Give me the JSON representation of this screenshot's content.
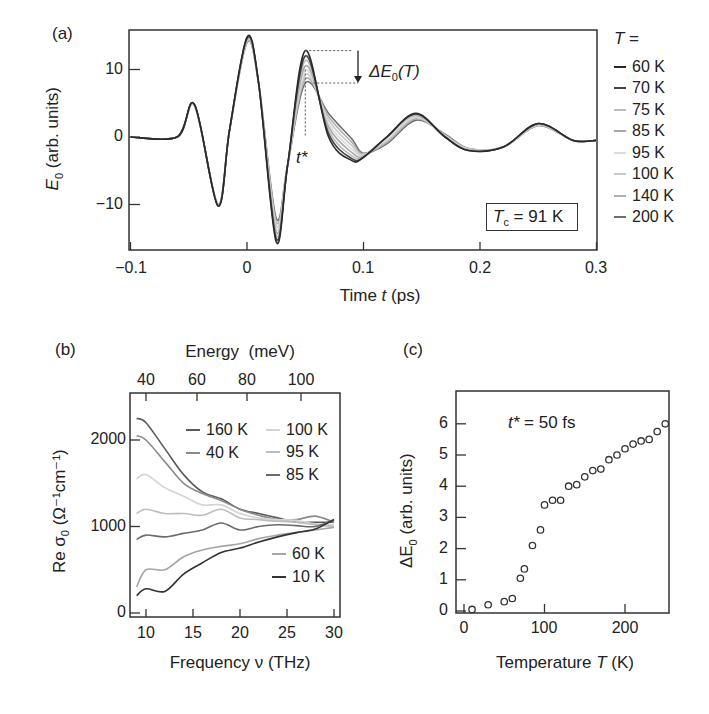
{
  "chart_data": [
    {
      "panel": "(a)",
      "type": "line",
      "title": "",
      "xlabel": "Time t (ps)",
      "ylabel": "E0 (arb. units)",
      "xlim": [
        -0.1,
        0.3
      ],
      "ylim": [
        -16,
        15
      ],
      "xticks": [
        "-0.1",
        "0",
        "0.1",
        "0.2",
        "0.3"
      ],
      "yticks": [
        "-10",
        "0",
        "10"
      ],
      "legend_title": "T =",
      "legend_position": "right outside",
      "annotations": [
        "ΔE0(T)",
        "t*",
        "Tc = 91 K"
      ],
      "x": [
        -0.1,
        -0.06,
        -0.045,
        -0.025,
        -0.015,
        0,
        0.01,
        0.025,
        0.035,
        0.05,
        0.07,
        0.09,
        0.1,
        0.12,
        0.145,
        0.17,
        0.19,
        0.22,
        0.25,
        0.28,
        0.3
      ],
      "series": [
        {
          "name": "60 K",
          "values": [
            0,
            0,
            4.8,
            -10.2,
            1,
            14.8,
            8,
            -15.5,
            -4,
            12.8,
            0,
            -3.5,
            -3,
            0,
            3.5,
            0,
            -2,
            -1.5,
            2,
            -0.5,
            -0.5
          ]
        },
        {
          "name": "70 K",
          "values": [
            0,
            0,
            4.8,
            -10.2,
            1,
            14.6,
            8,
            -15,
            -4,
            12,
            0.5,
            -3.2,
            -3,
            0,
            3.4,
            0,
            -2,
            -1.5,
            2,
            -0.5,
            -0.5
          ]
        },
        {
          "name": "75 K",
          "values": [
            0,
            0,
            4.7,
            -10.1,
            1,
            14.5,
            8,
            -14.5,
            -4,
            11.3,
            1,
            -2.8,
            -2.9,
            0,
            3.3,
            0,
            -1.9,
            -1.5,
            1.9,
            -0.5,
            -0.5
          ]
        },
        {
          "name": "85 K",
          "values": [
            0,
            0,
            4.7,
            -10,
            1,
            14.4,
            8,
            -14,
            -4,
            10.5,
            1.5,
            -2.3,
            -2.8,
            0,
            3.2,
            0,
            -1.9,
            -1.5,
            1.9,
            -0.5,
            -0.5
          ]
        },
        {
          "name": "95 K",
          "values": [
            0,
            0,
            4.6,
            -10,
            1,
            14.3,
            8,
            -13.5,
            -4,
            9.8,
            2,
            -1.8,
            -2.7,
            -0.3,
            3,
            0.1,
            -1.8,
            -1.5,
            1.8,
            -0.5,
            -0.5
          ]
        },
        {
          "name": "100 K",
          "values": [
            0,
            0,
            4.6,
            -10,
            1,
            14.2,
            8,
            -13,
            -4,
            9.2,
            2.5,
            -1.3,
            -2.6,
            -0.5,
            2.9,
            0.2,
            -1.8,
            -1.5,
            1.8,
            -0.5,
            -0.5
          ]
        },
        {
          "name": "140 K",
          "values": [
            0,
            0,
            4.6,
            -10,
            1,
            14.1,
            8,
            -12.5,
            -4,
            8.6,
            3,
            -0.8,
            -2.5,
            -0.8,
            2.7,
            0.3,
            -1.7,
            -1.5,
            1.7,
            -0.5,
            -0.5
          ]
        },
        {
          "name": "200 K",
          "values": [
            0,
            0,
            4.6,
            -10,
            1,
            14,
            8,
            -12,
            -4,
            8,
            3.5,
            -0.3,
            -2.4,
            -1,
            2.5,
            0.4,
            -1.7,
            -1.5,
            1.7,
            -0.5,
            -0.5
          ]
        }
      ]
    },
    {
      "panel": "(b)",
      "type": "line",
      "title": "",
      "xlabel": "Frequency ν (THz)",
      "ylabel": "Re σ0 (Ω⁻¹cm⁻¹)",
      "top_xlabel": "Energy (meV)",
      "xlim": [
        8.5,
        30.5
      ],
      "ylim": [
        -50,
        2450
      ],
      "xticks": [
        "10",
        "15",
        "20",
        "25",
        "30"
      ],
      "yticks": [
        "0",
        "1000",
        "2000"
      ],
      "top_xticks": [
        "40",
        "60",
        "80",
        "100"
      ],
      "legend_position": "inside",
      "x": [
        9,
        10,
        12,
        14,
        16,
        18,
        20,
        22,
        24,
        26,
        28,
        30
      ],
      "series": [
        {
          "name": "160 K",
          "values": [
            2250,
            2200,
            1900,
            1600,
            1400,
            1320,
            1200,
            1150,
            1100,
            1050,
            1050,
            1050
          ]
        },
        {
          "name": "40 K",
          "values": [
            2050,
            2000,
            1750,
            1500,
            1380,
            1300,
            1200,
            1130,
            1080,
            1080,
            1120,
            1050
          ]
        },
        {
          "name": "100 K",
          "values": [
            1550,
            1600,
            1450,
            1350,
            1250,
            1250,
            1150,
            1100,
            1080,
            1070,
            1030,
            1020
          ]
        },
        {
          "name": "95 K",
          "values": [
            1150,
            1200,
            1150,
            1150,
            1130,
            1200,
            1100,
            1080,
            1060,
            1050,
            1020,
            1000
          ]
        },
        {
          "name": "85 K",
          "values": [
            850,
            900,
            880,
            920,
            960,
            1040,
            960,
            1000,
            1020,
            1010,
            1000,
            1080
          ]
        },
        {
          "name": "60 K",
          "values": [
            300,
            500,
            500,
            650,
            730,
            770,
            800,
            860,
            900,
            930,
            960,
            990
          ]
        },
        {
          "name": "10 K",
          "values": [
            200,
            280,
            250,
            450,
            580,
            700,
            750,
            820,
            880,
            930,
            970,
            1080
          ]
        }
      ]
    },
    {
      "panel": "(c)",
      "type": "scatter",
      "title": "",
      "xlabel": "Temperature T (K)",
      "ylabel": "ΔE0 (arb. units)",
      "xlim": [
        -10,
        255
      ],
      "ylim": [
        0,
        7
      ],
      "xticks": [
        "0",
        "100",
        "200"
      ],
      "yticks": [
        "0",
        "1",
        "2",
        "3",
        "4",
        "5",
        "6"
      ],
      "annotations": [
        "t* = 50 fs"
      ],
      "series": [
        {
          "name": "ΔE0",
          "x": [
            10,
            30,
            50,
            60,
            70,
            75,
            85,
            95,
            100,
            110,
            120,
            130,
            140,
            150,
            160,
            170,
            180,
            190,
            200,
            210,
            220,
            230,
            240,
            250
          ],
          "values": [
            0.05,
            0.2,
            0.3,
            0.4,
            1.05,
            1.35,
            2.1,
            2.6,
            3.4,
            3.55,
            3.55,
            4.0,
            4.05,
            4.3,
            4.5,
            4.55,
            4.85,
            5.0,
            5.2,
            5.35,
            5.45,
            5.5,
            5.75,
            6.0
          ]
        }
      ]
    }
  ],
  "labels": {
    "a": {
      "panel": "(a)",
      "xlabel_pre": "Time ",
      "xlabel_var": "t",
      "xlabel_post": " (ps)",
      "ylabel_var": "E",
      "ylabel_sub": "0",
      "ylabel_post": " (arb. units)",
      "xticks": [
        "−0.1",
        "0",
        "0.1",
        "0.2",
        "0.3"
      ],
      "yticks": [
        "10",
        "0",
        "−10"
      ],
      "delta_var": "ΔE",
      "delta_sub": "0",
      "delta_post": "(T)",
      "tstar": "t*",
      "tc_var": "T",
      "tc_sub": "c",
      "tc_post": " = 91 K",
      "legend_title": "T =",
      "legend": [
        "60 K",
        "70 K",
        "75 K",
        "85 K",
        "95 K",
        "100 K",
        "140 K",
        "200 K"
      ]
    },
    "b": {
      "panel": "(b)",
      "top_label": "Energy  (meV)",
      "top_ticks": [
        "40",
        "60",
        "80",
        "100"
      ],
      "xticks": [
        "10",
        "15",
        "20",
        "25",
        "30"
      ],
      "yticks": [
        "2000",
        "1000",
        "0"
      ],
      "xlabel": "Frequency ν (THz)",
      "ylabel": "Re σ",
      "ylabel_sub": "0",
      "ylabel_post": " (Ω⁻¹cm⁻¹)",
      "legend": [
        "160 K",
        "40 K",
        "100 K",
        "95 K",
        "85 K",
        "60 K",
        "10 K"
      ]
    },
    "c": {
      "panel": "(c)",
      "xticks": [
        "0",
        "100",
        "200"
      ],
      "yticks": [
        "6",
        "5",
        "4",
        "3",
        "2",
        "1",
        "0"
      ],
      "xlabel_pre": "Temperature ",
      "xlabel_var": "T",
      "xlabel_post": " (K)",
      "ylabel": "ΔE",
      "ylabel_sub": "0",
      "ylabel_post": " (arb. units)",
      "annotation": "t* = 50 fs"
    }
  },
  "colors": {
    "a_series": [
      "#2a2a2a",
      "#444444",
      "#bdbdbd",
      "#a8a8a8",
      "#dcdcdc",
      "#c8c8c8",
      "#b0b0b0",
      "#6e6e6e"
    ],
    "b_series": [
      "#5a5a5a",
      "#8a8a8a",
      "#d4d4d4",
      "#bdbdbd",
      "#6a6a6a",
      "#a5a5a5",
      "#333333"
    ],
    "axis": "#333333",
    "marker": "#333333"
  }
}
